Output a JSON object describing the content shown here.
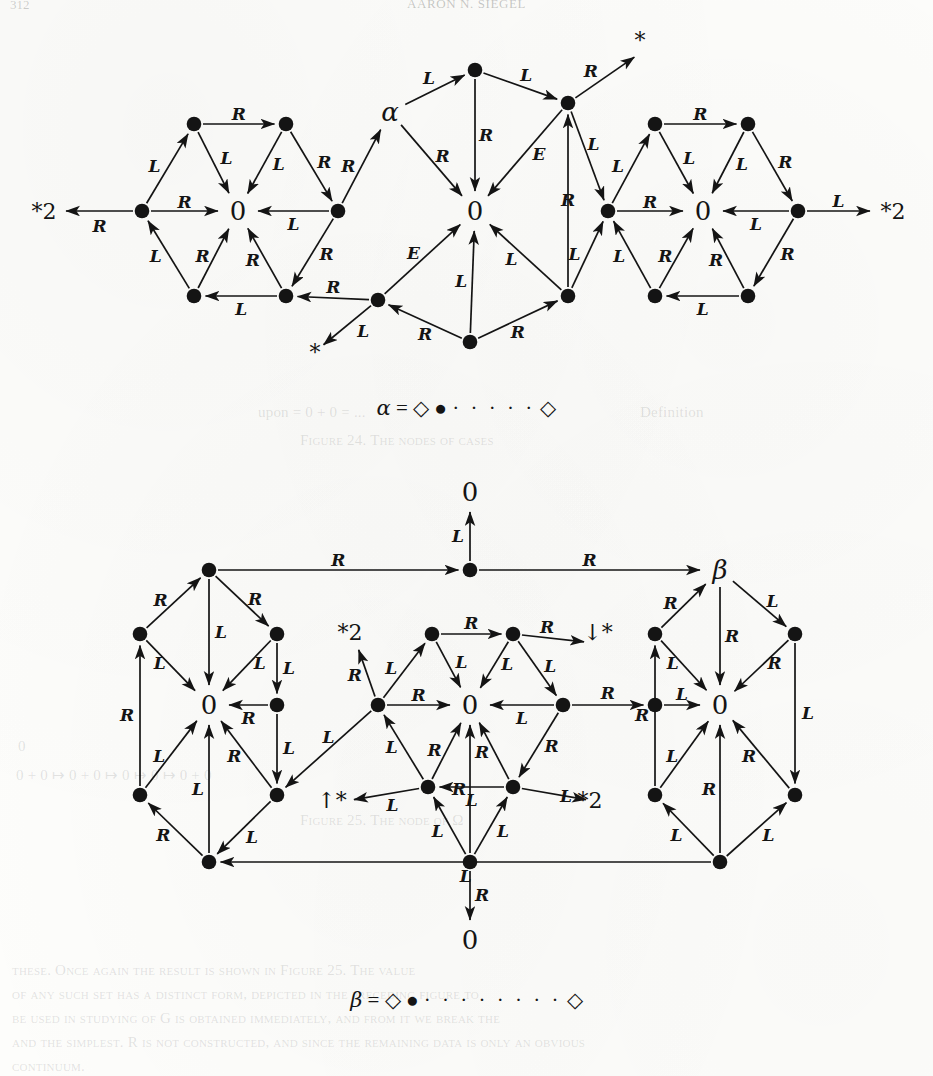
{
  "page": {
    "folio": "312",
    "running_head": "AARON N. SIEGEL",
    "background_color": "#fdfdfb",
    "ink_color": "#141414"
  },
  "ghost_text": [
    {
      "text": "upon = 0 + 0 = ...",
      "x": 258,
      "y": 404
    },
    {
      "text": "Definition",
      "x": 640,
      "y": 404
    },
    {
      "text": "Figure 24. The nodes of cases",
      "x": 300,
      "y": 432
    },
    {
      "text": "0",
      "x": 18,
      "y": 738
    },
    {
      "text": "0 + 0 ↦ 0 + 0 ↦ 0 ↦ 0 ↦ 0 + 0",
      "x": 16,
      "y": 766
    },
    {
      "text": "Figure 25. The node of Ω",
      "x": 300,
      "y": 812
    },
    {
      "text": "these. Once again the result is shown in Figure 25. The value",
      "x": 12,
      "y": 962
    },
    {
      "text": "of any such set has a distinct form, depicted in the preceding figure to",
      "x": 12,
      "y": 986
    },
    {
      "text": "be used in studying of G is obtained immediately, and from it we break the",
      "x": 12,
      "y": 1010
    },
    {
      "text": "and the simplest. R is not constructed, and since the remaining data is only an obvious",
      "x": 12,
      "y": 1034
    },
    {
      "text": "continuum.",
      "x": 12,
      "y": 1058
    }
  ],
  "figures": [
    {
      "id": "figure-top",
      "caption": {
        "lhs": "α",
        "eq": "=",
        "left_diamond": "◇",
        "filled_dot": "●",
        "dots": "· · · · ·",
        "right_diamond": "◇"
      },
      "external_labels": [
        {
          "name": "star2-left",
          "text": "*2"
        },
        {
          "name": "star2-right",
          "text": "*2"
        },
        {
          "name": "star-top",
          "text": "*"
        },
        {
          "name": "star-bottom",
          "text": "*"
        },
        {
          "name": "alpha-node",
          "text": "α"
        }
      ],
      "zero_nodes": 4,
      "edge_labels_used": [
        "L",
        "R",
        "E"
      ]
    },
    {
      "id": "figure-bottom",
      "caption": {
        "lhs": "β",
        "eq": "=",
        "left_diamond": "◇",
        "filled_dot": "●",
        "dots": "· · · · · · · ·",
        "right_diamond": "◇"
      },
      "external_labels": [
        {
          "name": "zero-top",
          "text": "0"
        },
        {
          "name": "zero-bottom",
          "text": "0"
        },
        {
          "name": "beta-node",
          "text": "β"
        },
        {
          "name": "star2-upper-left",
          "text": "*2"
        },
        {
          "name": "star2-lower-right",
          "text": "*2"
        },
        {
          "name": "star-down",
          "text": "↓*"
        },
        {
          "name": "star-up",
          "text": "↑*"
        }
      ],
      "zero_nodes": 4,
      "edge_labels_used": [
        "L",
        "R"
      ]
    }
  ],
  "figure_top": {
    "nodes": [
      {
        "id": "t_l_w",
        "x": 142,
        "y": 211,
        "type": "dot"
      },
      {
        "id": "t_l_nw",
        "x": 194,
        "y": 124,
        "type": "dot"
      },
      {
        "id": "t_l_ne",
        "x": 286,
        "y": 124,
        "type": "dot"
      },
      {
        "id": "t_l_c",
        "x": 238,
        "y": 211,
        "type": "zero",
        "label": "0"
      },
      {
        "id": "t_l_sw",
        "x": 194,
        "y": 296,
        "type": "dot"
      },
      {
        "id": "t_l_se",
        "x": 286,
        "y": 296,
        "type": "dot"
      },
      {
        "id": "t_l_e",
        "x": 338,
        "y": 211,
        "type": "dot"
      },
      {
        "id": "t_c_nw",
        "x": 390,
        "y": 112,
        "type": "alpha",
        "label": "α"
      },
      {
        "id": "t_c_n",
        "x": 475,
        "y": 70,
        "type": "dot"
      },
      {
        "id": "t_c_ne",
        "x": 568,
        "y": 103,
        "type": "dot"
      },
      {
        "id": "t_c_c",
        "x": 475,
        "y": 211,
        "type": "zero",
        "label": "0"
      },
      {
        "id": "t_c_sw",
        "x": 378,
        "y": 300,
        "type": "dot"
      },
      {
        "id": "t_c_s",
        "x": 470,
        "y": 342,
        "type": "dot"
      },
      {
        "id": "t_c_se",
        "x": 568,
        "y": 296,
        "type": "dot"
      },
      {
        "id": "t_r_w",
        "x": 608,
        "y": 211,
        "type": "dot"
      },
      {
        "id": "t_r_nw",
        "x": 655,
        "y": 124,
        "type": "dot"
      },
      {
        "id": "t_r_ne",
        "x": 748,
        "y": 124,
        "type": "dot"
      },
      {
        "id": "t_r_c",
        "x": 703,
        "y": 211,
        "type": "zero",
        "label": "0"
      },
      {
        "id": "t_r_sw",
        "x": 655,
        "y": 296,
        "type": "dot"
      },
      {
        "id": "t_r_se",
        "x": 748,
        "y": 296,
        "type": "dot"
      },
      {
        "id": "t_r_e",
        "x": 798,
        "y": 211,
        "type": "dot"
      }
    ],
    "terminals": [
      {
        "id": "t_star2_l",
        "x": 44,
        "y": 211,
        "text": "*2"
      },
      {
        "id": "t_star2_r",
        "x": 893,
        "y": 211,
        "text": "*2"
      },
      {
        "id": "t_star_tr",
        "x": 640,
        "y": 40,
        "text": "*"
      },
      {
        "id": "t_star_bl",
        "x": 315,
        "y": 352,
        "text": "*"
      }
    ]
  },
  "figure_bottom": {
    "nodes": [
      {
        "id": "b_zero_top",
        "x": 470,
        "y": 492,
        "type": "zero",
        "label": "0"
      },
      {
        "id": "b_n_hub",
        "x": 470,
        "y": 570,
        "type": "dot"
      },
      {
        "id": "b_l_top",
        "x": 209,
        "y": 570,
        "type": "dot"
      },
      {
        "id": "b_l_nw",
        "x": 140,
        "y": 634,
        "type": "dot"
      },
      {
        "id": "b_l_ne",
        "x": 277,
        "y": 634,
        "type": "dot"
      },
      {
        "id": "b_l_c",
        "x": 209,
        "y": 705,
        "type": "zero",
        "label": "0"
      },
      {
        "id": "b_l_ce",
        "x": 277,
        "y": 705,
        "type": "dot"
      },
      {
        "id": "b_l_sw",
        "x": 140,
        "y": 795,
        "type": "dot"
      },
      {
        "id": "b_l_se",
        "x": 277,
        "y": 795,
        "type": "dot"
      },
      {
        "id": "b_l_bot",
        "x": 209,
        "y": 862,
        "type": "dot"
      },
      {
        "id": "b_m_w",
        "x": 378,
        "y": 705,
        "type": "dot"
      },
      {
        "id": "b_m_nw",
        "x": 432,
        "y": 634,
        "type": "dot"
      },
      {
        "id": "b_m_ne",
        "x": 513,
        "y": 634,
        "type": "dot"
      },
      {
        "id": "b_m_c",
        "x": 470,
        "y": 705,
        "type": "zero",
        "label": "0"
      },
      {
        "id": "b_m_sw",
        "x": 428,
        "y": 787,
        "type": "dot"
      },
      {
        "id": "b_m_se",
        "x": 513,
        "y": 787,
        "type": "dot"
      },
      {
        "id": "b_m_e",
        "x": 563,
        "y": 705,
        "type": "dot"
      },
      {
        "id": "b_r_top",
        "x": 720,
        "y": 570,
        "type": "beta",
        "label": "β"
      },
      {
        "id": "b_r_nw",
        "x": 655,
        "y": 634,
        "type": "dot"
      },
      {
        "id": "b_r_ne",
        "x": 795,
        "y": 634,
        "type": "dot"
      },
      {
        "id": "b_r_c",
        "x": 720,
        "y": 705,
        "type": "zero",
        "label": "0"
      },
      {
        "id": "b_r_cw",
        "x": 655,
        "y": 705,
        "type": "dot"
      },
      {
        "id": "b_r_sw",
        "x": 655,
        "y": 795,
        "type": "dot"
      },
      {
        "id": "b_r_se",
        "x": 795,
        "y": 795,
        "type": "dot"
      },
      {
        "id": "b_r_bot",
        "x": 720,
        "y": 862,
        "type": "dot"
      },
      {
        "id": "b_zero_bot",
        "x": 470,
        "y": 940,
        "type": "zero",
        "label": "0"
      },
      {
        "id": "b_m_bot",
        "x": 470,
        "y": 862,
        "type": "dot"
      }
    ],
    "terminals": [
      {
        "id": "b_star2_ul",
        "x": 350,
        "y": 632,
        "text": "*2"
      },
      {
        "id": "b_star2_lr",
        "x": 590,
        "y": 800,
        "text": "*2"
      },
      {
        "id": "b_stardown",
        "x": 598,
        "y": 632,
        "text": "↓*"
      },
      {
        "id": "b_starup",
        "x": 332,
        "y": 800,
        "text": "↑*"
      }
    ]
  }
}
